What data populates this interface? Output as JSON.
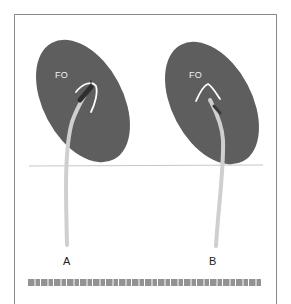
{
  "figure": {
    "panels": [
      {
        "id": "A",
        "label": "A",
        "structure_label": "FO",
        "description": "Catheter tip engaged against fossa ovalis, tenting the septum"
      },
      {
        "id": "B",
        "label": "B",
        "structure_label": "FO",
        "description": "Catheter tip at fossa ovalis with tented curve"
      }
    ],
    "caption_visible": false
  },
  "colors": {
    "septum": "#5e5e5e",
    "catheter": "#cfcfcf",
    "catheter_tip": "#2e2e2e",
    "tent_curve": "#ffffff",
    "baseline": "#b8b8b8",
    "frame": "#8a8a8a"
  }
}
